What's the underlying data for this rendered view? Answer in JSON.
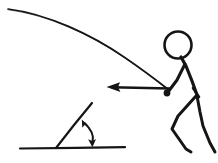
{
  "figure": {
    "canvas": {
      "width": 218,
      "height": 163
    },
    "background_color": "#ffffff",
    "ink_color": "#151515",
    "style": "hand-drawn line art"
  },
  "elements": {
    "trajectory": {
      "name": "projectile trajectory arc",
      "description": "Long downward-curving arc sweeping from the upper-left corner to the thrower's hand at the right",
      "start_point": [
        8,
        9
      ],
      "end_point": [
        169,
        90
      ],
      "stroke_width": 1.7
    },
    "thrower": {
      "name": "stick figure person",
      "posture": "bent forward, arm extended forward and down, legs in wide stride",
      "head": {
        "center": [
          178,
          45
        ],
        "radius": 13.5,
        "stroke_width": 2.6
      },
      "torso": {
        "from": [
          182,
          58
        ],
        "to": [
          197,
          96
        ],
        "stroke_width": 3.2
      },
      "arm": {
        "shoulder": [
          185,
          64
        ],
        "elbow": [
          176,
          83
        ],
        "hand": [
          168,
          92
        ],
        "stroke_width": 3.0
      },
      "front_leg": {
        "hip": [
          196,
          96
        ],
        "knee": [
          176,
          118
        ],
        "foot": [
          190,
          152
        ],
        "stroke_width": 3.0
      },
      "back_leg": {
        "hip": [
          198,
          97
        ],
        "knee": [
          202,
          124
        ],
        "foot": [
          214,
          152
        ],
        "stroke_width": 3.0
      }
    },
    "ball": {
      "name": "ball in hand",
      "center": [
        167,
        93
      ],
      "radius": 3.4
    },
    "velocity_arrow": {
      "name": "horizontal velocity vector",
      "direction": "left",
      "tail": [
        170,
        88
      ],
      "tip": [
        107,
        87
      ],
      "stroke_width": 2.4,
      "head_length": 11,
      "head_half_width": 5
    },
    "angle_diagram": {
      "name": "launch angle inset",
      "ground_line": {
        "from": [
          20,
          148
        ],
        "to": [
          125,
          148
        ],
        "stroke_width": 2.2
      },
      "ray": {
        "from": [
          56,
          148
        ],
        "to": [
          92,
          103
        ],
        "stroke_width": 2.2
      },
      "angle_degrees": 51,
      "arc_arrow": {
        "name": "double headed angle arc",
        "from_point": [
          83,
          121
        ],
        "control_point": [
          95,
          134
        ],
        "to_point": [
          92,
          145
        ],
        "stroke_width": 2.0,
        "arrowheads": [
          "start",
          "end"
        ]
      }
    }
  },
  "labels": {
    "alt_text": "Hand drawn diagram: a stick figure leans forward having thrown a ball; a long arc shows the ball's flight path from upper left down to the hand, a leftward horizontal arrow shows the velocity direction, and below left an inset shows a ground line with an inclined ray and a double headed arc marking the launch angle."
  }
}
